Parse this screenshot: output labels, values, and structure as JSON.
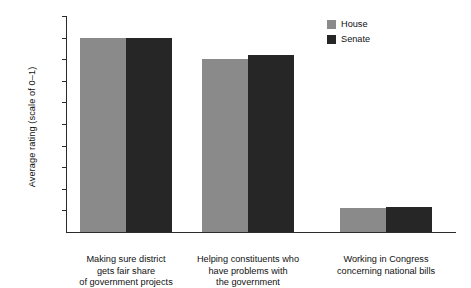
{
  "chart_data": {
    "type": "bar",
    "title": "",
    "subtitle": "",
    "xlabel": "",
    "ylabel": "Average rating (scale of 0–1)",
    "ylim": [
      0.0,
      1.0
    ],
    "ytick_labels": [
      "1.0",
      "0.9",
      "0.8",
      "0.7",
      "0.6",
      "0.5",
      "0.4",
      "0.3",
      "0.2",
      "0.1"
    ],
    "ytick_values": [
      1.0,
      0.9,
      0.8,
      0.7,
      0.6,
      0.5,
      0.4,
      0.3,
      0.2,
      0.1
    ],
    "grid": false,
    "legend_position": "top-right",
    "categories": [
      "Making sure district gets fair share of government projects",
      "Helping constituents who have problems with the government",
      "Working in Congress concerning national bills"
    ],
    "category_lines": [
      [
        "Making sure district",
        "gets fair share",
        "of government projects"
      ],
      [
        "Helping constituents who",
        "have problems with",
        "the government"
      ],
      [
        "Working in Congress",
        "concerning national bills"
      ]
    ],
    "series": [
      {
        "name": "House",
        "color": "#8a8a8a",
        "values": [
          0.9,
          0.8,
          0.11
        ]
      },
      {
        "name": "Senate",
        "color": "#262626",
        "values": [
          0.9,
          0.82,
          0.115
        ]
      }
    ]
  },
  "legend": {
    "items": [
      {
        "label": "House"
      },
      {
        "label": "Senate"
      }
    ]
  }
}
